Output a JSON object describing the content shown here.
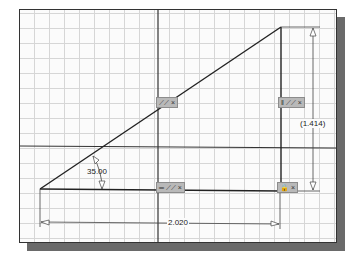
{
  "sketch": {
    "dimensions": {
      "angle": "35.00",
      "horizontal": "2.020",
      "vertical_reference": "(1.414)"
    },
    "constraint_glyphs": [
      {
        "id": "hypotenuse",
        "label": "⟋⟋ ×"
      },
      {
        "id": "vertical-edge",
        "label": "‖ ⟋⟋ ×"
      },
      {
        "id": "horizontal-edge",
        "label": "═ ⟋⟋ ×"
      },
      {
        "id": "corner-fix",
        "label": "🔒 ×"
      }
    ],
    "colors": {
      "line": "#222222",
      "grid": "#d6d6d6",
      "axis": "#333333",
      "glyph_bg": "#b9b9b9",
      "shadow": "#6a6a6a"
    }
  }
}
